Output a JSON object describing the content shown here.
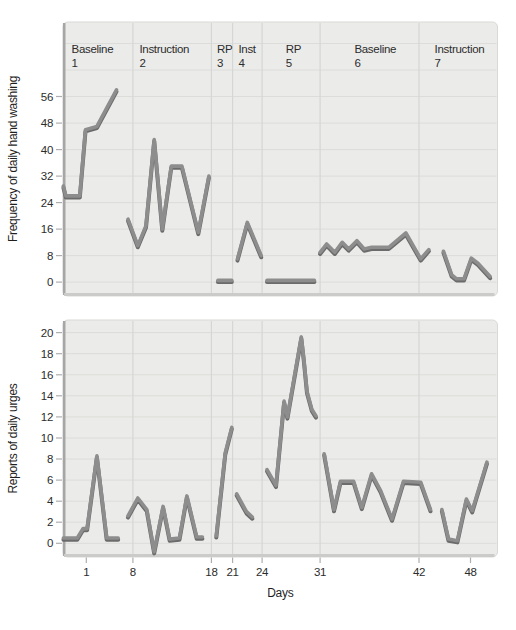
{
  "figure_title": "Multiple-phase single-subject design figure",
  "style": {
    "page_bg": "#ffffff",
    "plot_bg": "#ebebe9",
    "plot_border": "#d9d9d7",
    "grid": "#dcdcda",
    "boundary": "#d6d6d4",
    "line_main": "#8d8d8d",
    "line_shadow": "#6b6b6b",
    "spine_left": "#a6a6a6",
    "spine_bottom": "#cbcbc9",
    "tick": "#aeaeae",
    "text": "#2c2c2c"
  },
  "x_axis": {
    "label": "Days",
    "xlim": [
      -1.85,
      51.3
    ],
    "ticks": [
      {
        "label": "1",
        "day": 1
      },
      {
        "label": "8",
        "day": 6.7
      },
      {
        "label": "18",
        "day": 16.3
      },
      {
        "label": "21",
        "day": 18.9
      },
      {
        "label": "24",
        "day": 22.5
      },
      {
        "label": "31",
        "day": 29.6
      },
      {
        "label": "42",
        "day": 41.7
      },
      {
        "label": "48",
        "day": 48
      }
    ],
    "phase_boundaries": [
      6.7,
      16.3,
      18.9,
      22.5,
      29.6,
      41.7
    ]
  },
  "chart_data": [
    {
      "type": "line",
      "ylabel": "Frequency of daily hand washing",
      "ylim": [
        -4.2,
        78.5
      ],
      "yticks": [
        0,
        8,
        16,
        24,
        32,
        40,
        48,
        56
      ],
      "grid_values": [
        0,
        8,
        16,
        24,
        32,
        40,
        48,
        56,
        64,
        72
      ],
      "grid": true,
      "phases": [
        {
          "name": "Baseline",
          "number": "1",
          "label_day": -0.8
        },
        {
          "name": "Instruction",
          "number": "2",
          "label_day": 7.5
        },
        {
          "name": "RP",
          "number": "3",
          "label_day": 17.0
        },
        {
          "name": "Inst",
          "number": "4",
          "label_day": 19.6
        },
        {
          "name": "RP",
          "number": "5",
          "label_day": 25.4
        },
        {
          "name": "Baseline",
          "number": "6",
          "label_day": 33.8
        },
        {
          "name": "Instruction",
          "number": "7",
          "label_day": 43.6
        }
      ],
      "series": [
        {
          "phase": "Baseline 1",
          "points": [
            [
              -1.8,
              29
            ],
            [
              -1.5,
              26
            ],
            [
              0.2,
              26
            ],
            [
              0.9,
              46
            ],
            [
              2.3,
              47
            ],
            [
              4.7,
              58
            ]
          ]
        },
        {
          "phase": "Instruction 2",
          "points": [
            [
              6.1,
              19
            ],
            [
              7.3,
              11
            ],
            [
              8.3,
              17
            ],
            [
              9.3,
              43
            ],
            [
              10.3,
              16
            ],
            [
              11.4,
              35
            ],
            [
              12.7,
              35
            ],
            [
              14.7,
              15
            ],
            [
              16,
              32
            ]
          ]
        },
        {
          "phase": "RP 3",
          "points": [
            [
              17.1,
              0.5
            ],
            [
              18.8,
              0.5
            ]
          ]
        },
        {
          "phase": "Inst 4",
          "points": [
            [
              19.5,
              7
            ],
            [
              20.7,
              18
            ],
            [
              22.4,
              8
            ]
          ]
        },
        {
          "phase": "RP 5",
          "points": [
            [
              23.1,
              0.5
            ],
            [
              28.9,
              0.5
            ]
          ]
        },
        {
          "phase": "Baseline 6",
          "points": [
            [
              29.6,
              9
            ],
            [
              30.4,
              11.5
            ],
            [
              31.4,
              9
            ],
            [
              32.3,
              12
            ],
            [
              33.1,
              10
            ],
            [
              34.1,
              12.5
            ],
            [
              35,
              10
            ],
            [
              35.9,
              10.5
            ],
            [
              38,
              10.5
            ],
            [
              40.1,
              14.8
            ],
            [
              41.9,
              7
            ],
            [
              42.9,
              9.8
            ]
          ]
        },
        {
          "phase": "Instruction 7",
          "points": [
            [
              44.7,
              9.3
            ],
            [
              45.7,
              2.2
            ],
            [
              46.3,
              1
            ],
            [
              47.2,
              1
            ],
            [
              48.1,
              7.2
            ],
            [
              48.9,
              5.7
            ],
            [
              50.4,
              1.7
            ]
          ]
        }
      ]
    },
    {
      "type": "line",
      "ylabel": "Reports of daily urges",
      "ylim": [
        -1.3,
        21.2
      ],
      "yticks": [
        0,
        2,
        4,
        6,
        8,
        10,
        12,
        14,
        16,
        18,
        20
      ],
      "grid_values": [
        0,
        2,
        4,
        6,
        8,
        10,
        12,
        14,
        16,
        18,
        20
      ],
      "grid": true,
      "phases": [],
      "series": [
        {
          "phase": "Baseline 1",
          "points": [
            [
              -1.8,
              0.5
            ],
            [
              -0.1,
              0.5
            ],
            [
              0.6,
              1.4
            ],
            [
              1.1,
              1.4
            ],
            [
              2.3,
              8.3
            ],
            [
              3.5,
              0.5
            ],
            [
              4.9,
              0.5
            ]
          ]
        },
        {
          "phase": "Instruction 2",
          "points": [
            [
              6.1,
              2.6
            ],
            [
              7.3,
              4.3
            ],
            [
              8.4,
              3.2
            ],
            [
              9.3,
              -0.8
            ],
            [
              10.4,
              3.5
            ],
            [
              11.2,
              0.4
            ],
            [
              12.4,
              0.5
            ],
            [
              13.3,
              4.5
            ],
            [
              14.5,
              0.6
            ],
            [
              15.2,
              0.6
            ]
          ]
        },
        {
          "phase": "RP 3",
          "points": [
            [
              16.9,
              0.7
            ],
            [
              18,
              8.6
            ],
            [
              18.8,
              11
            ]
          ]
        },
        {
          "phase": "Inst 4",
          "points": [
            [
              19.4,
              4.7
            ],
            [
              20.6,
              3
            ],
            [
              21.3,
              2.5
            ]
          ]
        },
        {
          "phase": "RP 5",
          "points": [
            [
              23.1,
              7
            ],
            [
              24.2,
              5.5
            ],
            [
              25.2,
              13.5
            ],
            [
              25.6,
              12
            ],
            [
              27.3,
              19.6
            ],
            [
              27.6,
              17.5
            ],
            [
              28,
              14.4
            ],
            [
              28.6,
              12.7
            ],
            [
              29.1,
              12.1
            ]
          ]
        },
        {
          "phase": "Baseline 6",
          "points": [
            [
              30.1,
              8.5
            ],
            [
              31.3,
              3.2
            ],
            [
              32.1,
              5.9
            ],
            [
              33.7,
              5.9
            ],
            [
              34.7,
              3.4
            ],
            [
              35.9,
              6.6
            ],
            [
              37,
              5
            ],
            [
              38.4,
              2.3
            ],
            [
              39.8,
              5.9
            ],
            [
              41.9,
              5.8
            ],
            [
              43.1,
              3.2
            ]
          ]
        },
        {
          "phase": "Instruction 7",
          "points": [
            [
              44.5,
              3.2
            ],
            [
              45.3,
              0.4
            ],
            [
              46.4,
              0.25
            ],
            [
              47.5,
              4.2
            ],
            [
              48.2,
              3.1
            ],
            [
              50,
              7.7
            ]
          ]
        }
      ]
    }
  ]
}
